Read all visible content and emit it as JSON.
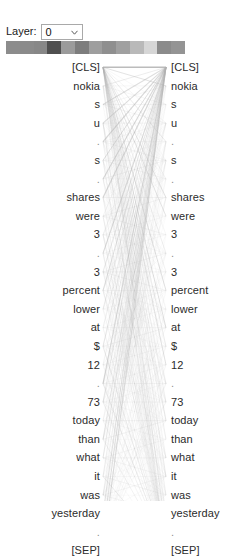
{
  "controls": {
    "layer_label": "Layer:",
    "layer_value": "0",
    "layer_options": [
      "0",
      "1",
      "2",
      "3",
      "4",
      "5",
      "6",
      "7",
      "8",
      "9",
      "10",
      "11"
    ],
    "chevron_icon": "chevron-down-icon"
  },
  "head_strip": {
    "colors": [
      "#8c8c8c",
      "#8a8a8a",
      "#878787",
      "#4f4f4f",
      "#9b9b9b",
      "#7d7d7d",
      "#9e9e9e",
      "#8f8f8f",
      "#a0a0a0",
      "#b9b9b9",
      "#d6d6d6",
      "#8b8b8b",
      "#949494"
    ]
  },
  "attention": {
    "line_color": "#b0b0b0",
    "tokens_left": [
      "[CLS]",
      "nokia",
      "s",
      "u",
      ".",
      "s",
      ".",
      "shares",
      "were",
      "3",
      ".",
      "3",
      "percent",
      "lower",
      "at",
      "$",
      "12",
      ".",
      "73",
      "today",
      "than",
      "what",
      "it",
      "was",
      "yesterday",
      ".",
      "[SEP]"
    ],
    "tokens_right": [
      "[CLS]",
      "nokia",
      "s",
      "u",
      ".",
      "s",
      ".",
      "shares",
      "were",
      "3",
      ".",
      "3",
      "percent",
      "lower",
      "at",
      "$",
      "12",
      ".",
      "73",
      "today",
      "than",
      "what",
      "it",
      "was",
      "yesterday",
      ".",
      "[SEP]"
    ]
  }
}
